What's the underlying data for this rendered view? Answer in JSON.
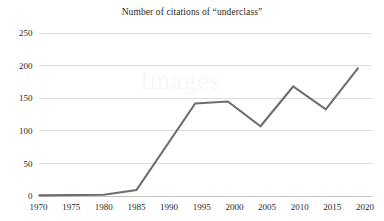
{
  "chart_data": {
    "type": "line",
    "title": "Number of citations of “underclass”",
    "xlabel": "",
    "ylabel": "",
    "xlim": [
      1970,
      2021
    ],
    "ylim": [
      0,
      250
    ],
    "grid": "horizontal",
    "legend": "none",
    "line_color": "#6e6e6e",
    "gridline_color": "#d4d4d4",
    "background_color": "#ffffff",
    "x_tick_labels": [
      "1970",
      "1975",
      "1980",
      "1985",
      "1990",
      "1995",
      "2000",
      "2005",
      "2010",
      "2015",
      "2020"
    ],
    "x_ticks": [
      1970,
      1975,
      1980,
      1985,
      1990,
      1995,
      2000,
      2005,
      2010,
      2015,
      2020
    ],
    "y_tick_labels": [
      "0",
      "50",
      "100",
      "150",
      "200",
      "250"
    ],
    "y_ticks": [
      0,
      50,
      100,
      150,
      200,
      250
    ],
    "series": [
      {
        "name": "citations",
        "x": [
          1970,
          1980,
          1985,
          1994,
          1999,
          2004,
          2009,
          2014,
          2019
        ],
        "values": [
          1,
          2,
          9,
          142,
          145,
          107,
          168,
          133,
          197
        ]
      }
    ]
  },
  "watermark": {
    "text": "Images"
  }
}
